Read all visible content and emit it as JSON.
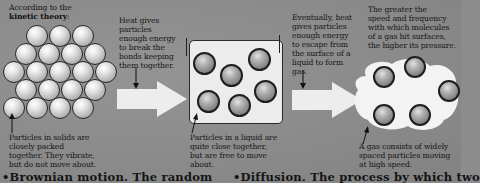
{
  "diagram": {
    "topic": "States of matter according to kinetic theory",
    "intro": {
      "prefix": "According to the",
      "term": "kinetic theory",
      "suffix": ":"
    },
    "annotations": {
      "heat_solid_to_liquid": [
        "Heat gives",
        "particles",
        "enough energy",
        "to break the",
        "bonds keeping",
        "them together."
      ],
      "heat_liquid_to_gas": [
        "Eventually, heat",
        "gives particles",
        "enough energy",
        "to escape from",
        "the surface of a",
        "liquid to form",
        "gas."
      ],
      "pressure": [
        "The greater the",
        "speed and frequency",
        "with which molecules",
        "of a gas hit surfaces,",
        "the higher its pressure."
      ],
      "solid": [
        "Particles in solids are",
        "closely packed",
        "together. They vibrate,",
        "but do not move about."
      ],
      "liquid": [
        "Particles in a liquid are",
        "quite close together,",
        "but are free to move",
        "about."
      ],
      "gas": [
        "A gas consists of widely",
        "spaced particles moving",
        "at high speed."
      ]
    },
    "states": [
      {
        "name": "solid",
        "particle_count": 20
      },
      {
        "name": "liquid",
        "particle_count": 6
      },
      {
        "name": "gas",
        "particle_count": 5
      }
    ],
    "footer": {
      "left": "•Brownian motion. The random",
      "right": "•Diffusion. The process by which two"
    },
    "colors": {
      "background": "#8c8c8c",
      "box": "#ececec",
      "arrow": "#ededed",
      "text": "#141414"
    }
  }
}
